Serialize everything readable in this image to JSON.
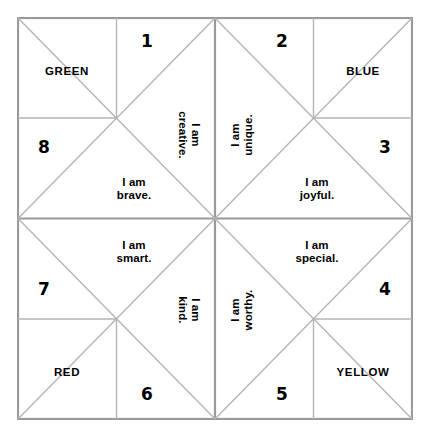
{
  "page": {
    "background_color": "#ffffff",
    "line_color": "#aaaaaa",
    "frame_color": "#999999",
    "text_color": "#000000"
  },
  "quadrants": [
    {
      "id": "top-left",
      "color_label": "GREEN",
      "numbers": [
        "1",
        "8"
      ],
      "affirmations": [
        "I am\ncreative.",
        "I am\nbrave."
      ]
    },
    {
      "id": "top-right",
      "color_label": "BLUE",
      "numbers": [
        "2",
        "3"
      ],
      "affirmations": [
        "I am\nunique.",
        "I am\njoyful."
      ]
    },
    {
      "id": "bottom-left",
      "color_label": "RED",
      "numbers": [
        "7",
        "6"
      ],
      "affirmations": [
        "I am\nsmart.",
        "I am\nkind."
      ]
    },
    {
      "id": "bottom-right",
      "color_label": "YELLOW",
      "numbers": [
        "4",
        "5"
      ],
      "affirmations": [
        "I am\nspecial.",
        "I am\nworthy."
      ]
    }
  ],
  "cells": {
    "color_green": "GREEN",
    "color_blue": "BLUE",
    "color_red": "RED",
    "color_yellow": "YELLOW",
    "number_1": "1",
    "number_2": "2",
    "number_3": "3",
    "number_4": "4",
    "number_5": "5",
    "number_6": "6",
    "number_7": "7",
    "number_8": "8",
    "affirm_creative": "I am\ncreative.",
    "affirm_unique": "I am\nunique.",
    "affirm_brave": "I am\nbrave.",
    "affirm_joyful": "I am\njoyful.",
    "affirm_smart": "I am\nsmart.",
    "affirm_special": "I am\nspecial.",
    "affirm_kind": "I am\nkind.",
    "affirm_worthy": "I am\nworthy."
  }
}
